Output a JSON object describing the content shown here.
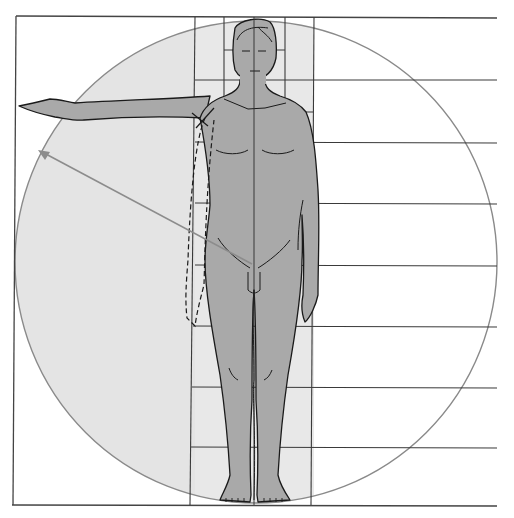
{
  "diagram": {
    "type": "human-proportions",
    "colors": {
      "background": "#ffffff",
      "circle_fill": "#e4e4e4",
      "circle_stroke": "#8a8a8a",
      "body_fill": "#a9a9a9",
      "outline": "#1a1a1a",
      "grid_line": "#3a3a3a",
      "arrow": "#8c8c8c"
    },
    "grid": {
      "horizontal_lines_y": [
        17,
        80,
        142,
        203,
        265,
        326,
        387,
        447,
        505
      ],
      "vertical_lines_x": [
        195,
        224,
        285,
        314
      ],
      "frame_left_x": 15,
      "right_extent_x": 497
    },
    "circle": {
      "cx": 256,
      "cy": 262,
      "r": 241
    },
    "arrow": {
      "from": [
        252,
        264
      ],
      "to": [
        38,
        150
      ]
    },
    "labels": []
  }
}
